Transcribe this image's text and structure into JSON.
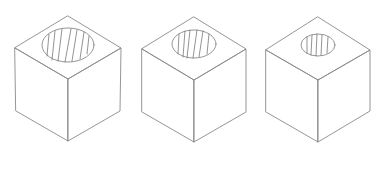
{
  "diagram": {
    "type": "isometric-cubes-with-cylindrical-holes",
    "background": "#ffffff",
    "line_color": "#8a8a8a",
    "hatch_color": "#777777",
    "line_width": 0.9,
    "cubes": [
      {
        "id": "cube-1",
        "hole_size": "large",
        "vertices": {
          "top": [
            68,
            16
          ],
          "left": [
            15,
            48
          ],
          "right": [
            121,
            48
          ],
          "center": [
            68,
            79
          ],
          "bottom_left": [
            16,
            111
          ],
          "bottom_right": [
            120,
            111
          ],
          "bottom": [
            68,
            141
          ]
        },
        "hole": {
          "cx": 68,
          "cy": 45,
          "rx": 26,
          "ry": 17
        },
        "hatch_lines": [
          [
            [
              49,
              34
            ],
            [
              47,
              56
            ]
          ],
          [
            [
              55,
              31
            ],
            [
              52,
              60
            ]
          ],
          [
            [
              62,
              29
            ],
            [
              58,
              61
            ]
          ],
          [
            [
              71,
              29
            ],
            [
              65,
              62
            ]
          ],
          [
            [
              77,
              30
            ],
            [
              72,
              61
            ]
          ],
          [
            [
              84,
              32
            ],
            [
              80,
              59
            ]
          ],
          [
            [
              89,
              36
            ],
            [
              87,
              54
            ]
          ]
        ]
      },
      {
        "id": "cube-2",
        "hole_size": "medium",
        "vertices": {
          "top": [
            194,
            17
          ],
          "left": [
            142,
            49
          ],
          "right": [
            246,
            49
          ],
          "center": [
            194,
            80
          ],
          "bottom_left": [
            142,
            112
          ],
          "bottom_right": [
            246,
            112
          ],
          "bottom": [
            194,
            142
          ]
        },
        "hole": {
          "cx": 194,
          "cy": 44,
          "rx": 22,
          "ry": 14
        },
        "hatch_lines": [
          [
            [
              179,
              34
            ],
            [
              178,
              54
            ]
          ],
          [
            [
              185,
              31
            ],
            [
              183,
              57
            ]
          ],
          [
            [
              190,
              30
            ],
            [
              187,
              58
            ]
          ],
          [
            [
              197,
              30
            ],
            [
              193,
              58
            ]
          ],
          [
            [
              203,
              31
            ],
            [
              199,
              57
            ]
          ],
          [
            [
              209,
              34
            ],
            [
              207,
              54
            ]
          ]
        ]
      },
      {
        "id": "cube-3",
        "hole_size": "small",
        "vertices": {
          "top": [
            318,
            17
          ],
          "left": [
            266,
            50
          ],
          "right": [
            370,
            50
          ],
          "center": [
            318,
            80
          ],
          "bottom_left": [
            266,
            112
          ],
          "bottom_right": [
            370,
            111
          ],
          "bottom": [
            318,
            142
          ]
        },
        "hole": {
          "cx": 318,
          "cy": 45,
          "rx": 17,
          "ry": 11
        },
        "hatch_lines": [
          [
            [
              307,
              37
            ],
            [
              307,
              53
            ]
          ],
          [
            [
              312,
              35
            ],
            [
              311,
              55
            ]
          ],
          [
            [
              317,
              34
            ],
            [
              316,
              56
            ]
          ],
          [
            [
              322,
              35
            ],
            [
              321,
              55
            ]
          ],
          [
            [
              328,
              37
            ],
            [
              327,
              53
            ]
          ]
        ]
      }
    ]
  }
}
